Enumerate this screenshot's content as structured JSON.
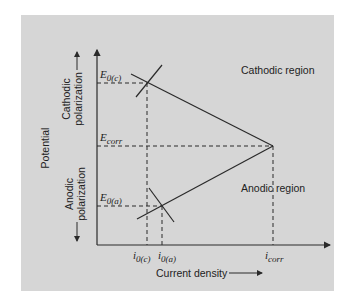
{
  "diagram": {
    "type": "evans-diagram",
    "colors": {
      "panel_background": "#d6d6d6",
      "line": "#2a2a2a",
      "text": "#222222"
    },
    "axes": {
      "y_label": "Potential",
      "x_label": "Current density",
      "x_arrow": "→"
    },
    "polarization": {
      "cathodic_line1": "Cathodic",
      "cathodic_line2": "polarization",
      "anodic_line1": "Anodic",
      "anodic_line2": "polarization"
    },
    "regions": {
      "cathodic": "Cathodic region",
      "anodic": "Anodic region"
    },
    "potential_labels": {
      "e0c_main": "E",
      "e0c_sub": "0(c)",
      "ecorr_main": "E",
      "ecorr_sub": "corr",
      "e0a_main": "E",
      "e0a_sub": "0(a)"
    },
    "current_labels": {
      "i0c_main": "i",
      "i0c_sub": "0(c)",
      "i0a_main": "i",
      "i0a_sub": "0(a)",
      "icorr_main": "i",
      "icorr_sub": "corr"
    }
  }
}
